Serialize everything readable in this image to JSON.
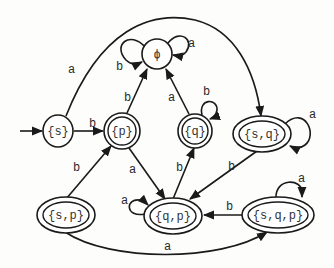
{
  "diagram": {
    "type": "DFA state diagram",
    "start_state": "{s}",
    "states": [
      {
        "id": "phi",
        "label": "ϕ",
        "accepting": false
      },
      {
        "id": "s",
        "label": "{s}",
        "accepting": false
      },
      {
        "id": "p",
        "label": "{p}",
        "accepting": true
      },
      {
        "id": "q",
        "label": "{q}",
        "accepting": true
      },
      {
        "id": "sq",
        "label": "{s,q}",
        "accepting": true
      },
      {
        "id": "sp",
        "label": "{s,p}",
        "accepting": true
      },
      {
        "id": "qp",
        "label": "{q,p}",
        "accepting": true
      },
      {
        "id": "sqp",
        "label": "{s,q,p}",
        "accepting": true
      }
    ],
    "transitions": [
      {
        "from": "phi",
        "to": "phi",
        "label": "a"
      },
      {
        "from": "phi",
        "to": "phi",
        "label": "b"
      },
      {
        "from": "s",
        "to": "sq",
        "label": "a"
      },
      {
        "from": "s",
        "to": "p",
        "label": "b"
      },
      {
        "from": "p",
        "to": "phi",
        "label": "b"
      },
      {
        "from": "p",
        "to": "qp",
        "label": "a"
      },
      {
        "from": "q",
        "to": "phi",
        "label": "a"
      },
      {
        "from": "q",
        "to": "q",
        "label": "b"
      },
      {
        "from": "sq",
        "to": "sq",
        "label": "a"
      },
      {
        "from": "sq",
        "to": "qp",
        "label": "b"
      },
      {
        "from": "sp",
        "to": "p",
        "label": "b"
      },
      {
        "from": "sp",
        "to": "sqp",
        "label": "a"
      },
      {
        "from": "qp",
        "to": "qp",
        "label": "a"
      },
      {
        "from": "qp",
        "to": "q",
        "label": "b"
      },
      {
        "from": "sqp",
        "to": "sqp",
        "label": "a"
      },
      {
        "from": "sqp",
        "to": "qp",
        "label": "b"
      }
    ]
  }
}
